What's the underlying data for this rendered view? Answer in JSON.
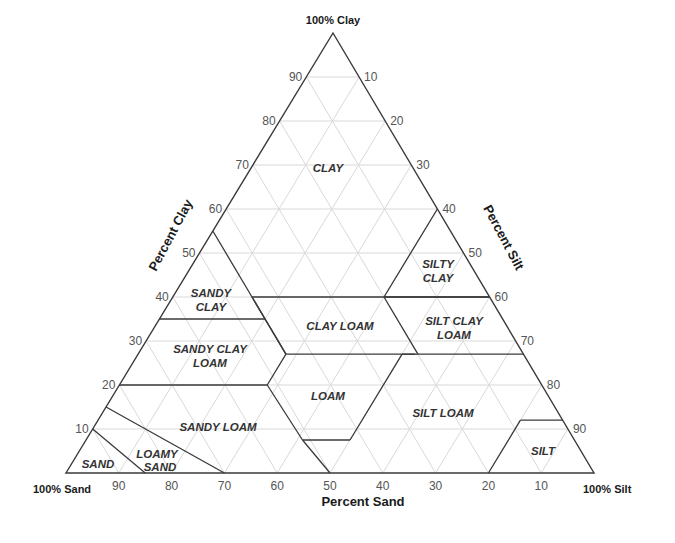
{
  "diagram": {
    "corners": {
      "clay": "100% Clay",
      "sand": "100% Sand",
      "silt": "100% Silt"
    },
    "axes": {
      "clay": {
        "title": "Percent Clay",
        "ticks": [
          "10",
          "20",
          "30",
          "40",
          "50",
          "60",
          "70",
          "80",
          "90"
        ]
      },
      "silt": {
        "title": "Percent Silt",
        "ticks": [
          "10",
          "20",
          "30",
          "40",
          "50",
          "60",
          "70",
          "80",
          "90"
        ]
      },
      "sand": {
        "title": "Percent Sand",
        "ticks": [
          "90",
          "80",
          "70",
          "60",
          "50",
          "40",
          "30",
          "20",
          "10"
        ]
      }
    },
    "regions": [
      {
        "name": "CLAY",
        "lines": [
          "CLAY"
        ]
      },
      {
        "name": "SILTY CLAY",
        "lines": [
          "SILTY",
          "CLAY"
        ]
      },
      {
        "name": "SANDY CLAY",
        "lines": [
          "SANDY",
          "CLAY"
        ]
      },
      {
        "name": "CLAY LOAM",
        "lines": [
          "CLAY LOAM"
        ]
      },
      {
        "name": "SILT CLAY LOAM",
        "lines": [
          "SILT CLAY",
          "LOAM"
        ]
      },
      {
        "name": "SANDY CLAY LOAM",
        "lines": [
          "SANDY CLAY",
          "LOAM"
        ]
      },
      {
        "name": "LOAM",
        "lines": [
          "LOAM"
        ]
      },
      {
        "name": "SILT LOAM",
        "lines": [
          "SILT LOAM"
        ]
      },
      {
        "name": "SANDY LOAM",
        "lines": [
          "SANDY LOAM"
        ]
      },
      {
        "name": "LOAMY SAND",
        "lines": [
          "LOAMY",
          "SAND"
        ]
      },
      {
        "name": "SAND",
        "lines": [
          "SAND"
        ]
      },
      {
        "name": "SILT",
        "lines": [
          "SILT"
        ]
      }
    ],
    "colors": {
      "outline": "#3a3a3a",
      "grid": "#d9d9d9",
      "text": "#333333"
    }
  }
}
